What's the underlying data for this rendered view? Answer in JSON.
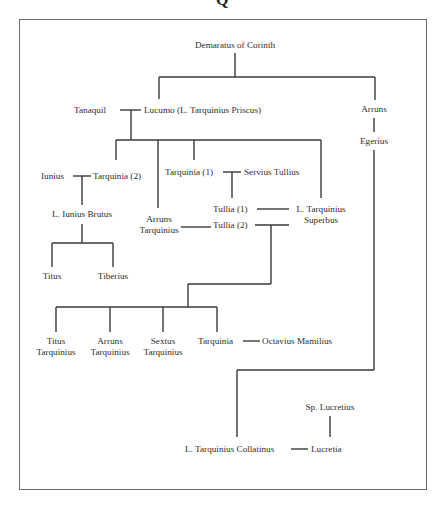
{
  "header_glyph": "Q",
  "people": {
    "demaratus": "Demaratus of Corinth",
    "tanaquil": "Tanaquil",
    "lucumo": "Lucumo (L. Tarquinius Priscus)",
    "arruns_top": "Arruns",
    "egerius": "Egerius",
    "iunius": "Iunius",
    "tarquinia2": "Tarquinia (2)",
    "tarquinia1": "Tarquinia (1)",
    "servius": "Servius Tullius",
    "brutus": "L. Iunius Brutus",
    "tullia1": "Tullia (1)",
    "superbus_1": "L. Tarquinius",
    "superbus_2": "Superbus",
    "arruns_t_1": "Arruns",
    "arruns_t_2": "Tarquinius",
    "tullia2": "Tullia (2)",
    "titus": "Titus",
    "tiberius": "Tiberius",
    "titus_t_1": "Titus",
    "titus_t_2": "Tarquinius",
    "arruns_c_1": "Arruns",
    "arruns_c_2": "Tarquinius",
    "sextus_1": "Sextus",
    "sextus_2": "Tarquinius",
    "tarquinia_c": "Tarquinia",
    "octavius": "Octavius Mamilius",
    "lucretius": "Sp. Lucretius",
    "collatinus": "L. Tarquinius Collatinus",
    "lucretia": "Lucretia"
  },
  "colors": {
    "line": "#3a3a3a",
    "frame": "#6b6b6b",
    "text": "#2e2e2e"
  }
}
